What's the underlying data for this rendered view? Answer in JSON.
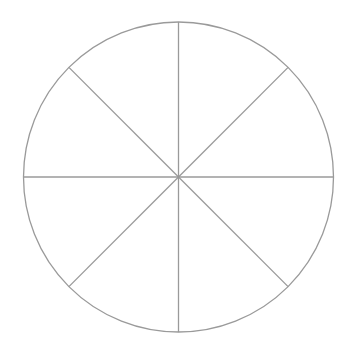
{
  "diagram": {
    "type": "segmented-circle",
    "segments": 8,
    "center": [
      178.5,
      177
    ],
    "radius": 155,
    "stroke_color": "#9a9a9a",
    "fill_color": "#ffffff",
    "stroke_width": 1.3,
    "divider_angles_deg": [
      0,
      45,
      90,
      135,
      180,
      225,
      270,
      315
    ]
  }
}
